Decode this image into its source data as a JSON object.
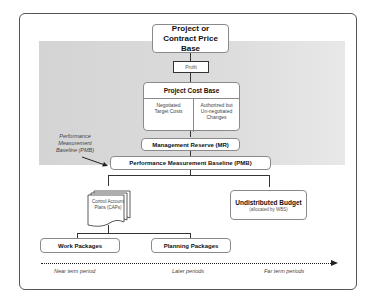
{
  "diagram": {
    "nodes": {
      "price_base": "Project or Contract Price Base",
      "profit": "Profit",
      "cost_base": {
        "title": "Project Cost Base",
        "left": "Negotiated Target Costs",
        "right": "Authorized but Un-negotiated Changes"
      },
      "mr": "Management Reserve (MR)",
      "pmb": "Performance Measurement Baseline (PMB)",
      "caps": "Control Account Plans (CAPs)",
      "undistributed": {
        "title": "Undistributed Budget",
        "subtitle": "(allocated by WBS)"
      },
      "work_packages": "Work Packages",
      "planning_packages": "Planning Packages"
    },
    "annotation": "Performance Measurement Baseline (PMB)",
    "timeline": {
      "near": "Near term period",
      "later": "Later periods",
      "far": "Far term periods"
    },
    "colors": {
      "shaded_region": "#d8d8d8",
      "box_border": "#8a8a8a",
      "connector": "#333333"
    }
  }
}
